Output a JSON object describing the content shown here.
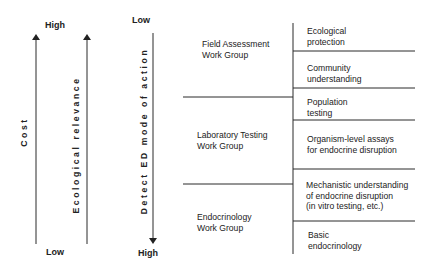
{
  "axes": {
    "cost": {
      "label": "Cost",
      "top": "High",
      "bottom": "Low",
      "direction": "up"
    },
    "ecological_relevance": {
      "label": "Ecological relevance",
      "direction": "up"
    },
    "detect_ed": {
      "label": "Detect ED mode of action",
      "top": "Low",
      "bottom": "High",
      "direction": "down"
    }
  },
  "work_groups": [
    {
      "label_line1": "Field Assessment",
      "label_line2": "Work Group"
    },
    {
      "label_line1": "Laboratory Testing",
      "label_line2": "Work Group"
    },
    {
      "label_line1": "Endocrinology",
      "label_line2": "Work Group"
    }
  ],
  "levels": [
    {
      "line1": "Ecological",
      "line2": "protection"
    },
    {
      "line1": "Community",
      "line2": "understanding"
    },
    {
      "line1": "Population",
      "line2": "testing"
    },
    {
      "line1": "Organism-level assays",
      "line2": "for endocrine disruption"
    },
    {
      "line1": "Mechanistic understanding",
      "line2": "of endocrine disruption",
      "line3": "(in vitro testing, etc.)"
    },
    {
      "line1": "Basic",
      "line2": "endocrinology"
    }
  ],
  "colors": {
    "line": "#2a2a2a",
    "text": "#222222",
    "background": "#ffffff"
  }
}
